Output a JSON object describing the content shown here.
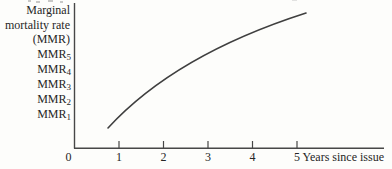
{
  "figure": {
    "kind": "scanned textbook figure",
    "colors": {
      "background": "#fdfdfb",
      "axis_ink": "#474747",
      "curve_ink": "#3f3f3f",
      "text_ink": "#262626"
    }
  },
  "chart_data": {
    "type": "line",
    "title": "",
    "x_axis": {
      "title": "Years since issue",
      "tick_labels": [
        "0",
        "1",
        "2",
        "3",
        "4",
        "5"
      ],
      "range_years": [
        0,
        7
      ]
    },
    "y_axis": {
      "title_lines": [
        "Marginal",
        "mortality rate",
        "(MMR)"
      ],
      "labels": [
        {
          "base": "MMR",
          "sub": "5"
        },
        {
          "base": "MMR",
          "sub": "4"
        },
        {
          "base": "MMR",
          "sub": "3"
        },
        {
          "base": "MMR",
          "sub": "2"
        },
        {
          "base": "MMR",
          "sub": "1"
        }
      ],
      "scale": "qualitative (no numeric ticks)"
    },
    "series": [
      {
        "name": "Marginal mortality rate curve",
        "shape": "concave-increasing",
        "x_years": [
          0.76,
          1.0,
          2.0,
          3.0,
          4.0,
          5.0,
          5.27
        ],
        "y_mmr_index": [
          0.1,
          0.8,
          3.3,
          5.0,
          6.4,
          7.5,
          7.8
        ]
      }
    ],
    "curve_px": {
      "start": [
        108,
        128
      ],
      "control": [
        175,
        55
      ],
      "end": [
        306,
        13
      ]
    },
    "grid": false,
    "legend": false
  }
}
